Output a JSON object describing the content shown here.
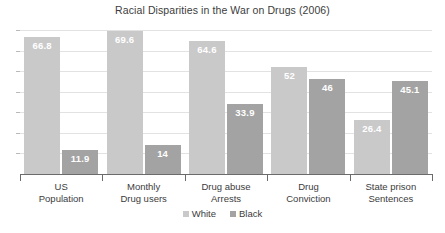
{
  "chart_data": {
    "type": "bar",
    "title": "Racial Disparities in the War on Drugs (2006)",
    "xlabel": "",
    "ylabel": "",
    "ylim": [
      0,
      70
    ],
    "grid": true,
    "gridline_count": 7,
    "legend_position": "bottom-center",
    "categories": [
      "US Population",
      "Monthly Drug users",
      "Drug abuse Arrests",
      "Drug Conviction",
      "State prison Sentences"
    ],
    "categories_lines": [
      [
        "US",
        "Population"
      ],
      [
        "Monthly",
        "Drug users"
      ],
      [
        "Drug abuse",
        "Arrests"
      ],
      [
        "Drug",
        "Conviction"
      ],
      [
        "State prison",
        "Sentences"
      ]
    ],
    "series": [
      {
        "name": "White",
        "color": "#c9c9c9",
        "values": [
          66.8,
          69.6,
          64.6,
          52,
          26.4
        ],
        "labels": [
          "66.8",
          "69.6",
          "64.6",
          "52",
          "26.4"
        ]
      },
      {
        "name": "Black",
        "color": "#a3a3a3",
        "values": [
          11.9,
          14,
          33.9,
          46,
          45.1
        ],
        "labels": [
          "11.9",
          "14",
          "33.9",
          "46",
          "45.1"
        ]
      }
    ]
  },
  "colors": {
    "background": "#ffffff",
    "gridline": "#e2e2e2",
    "axis": "#6b6b6b",
    "text": "#3c3c3c",
    "data_label": "#ffffff"
  }
}
